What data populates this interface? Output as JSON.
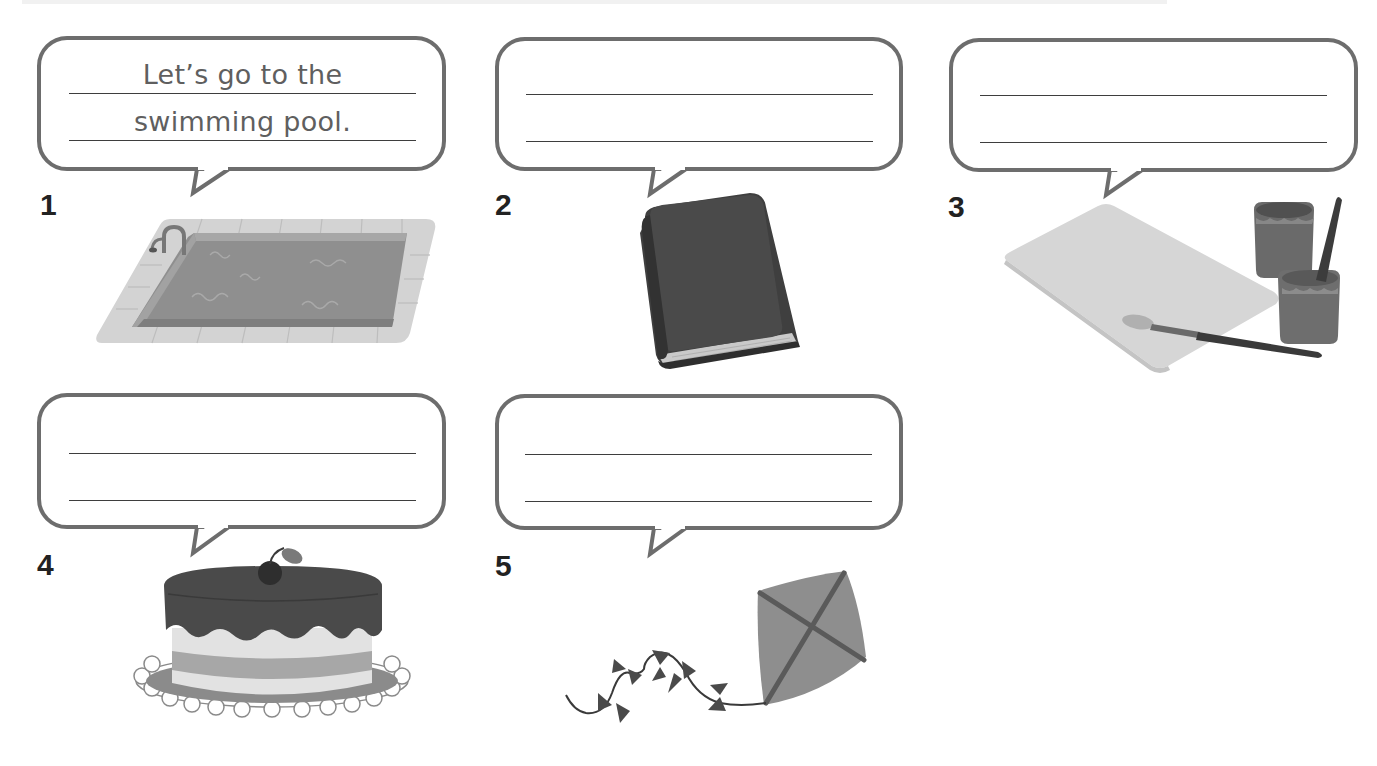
{
  "worksheet": {
    "exercises": [
      {
        "number": "1",
        "picture": "swimming-pool",
        "answer_lines": [
          "Let’s go to the",
          "swimming pool."
        ]
      },
      {
        "number": "2",
        "picture": "book",
        "answer_lines": [
          "",
          ""
        ]
      },
      {
        "number": "3",
        "picture": "paper-and-paints",
        "answer_lines": [
          "",
          ""
        ]
      },
      {
        "number": "4",
        "picture": "cake",
        "answer_lines": [
          "",
          ""
        ]
      },
      {
        "number": "5",
        "picture": "kite",
        "answer_lines": [
          "",
          ""
        ]
      }
    ]
  },
  "colors": {
    "bubble_border": "#6d6d6d",
    "answer_line": "#3e3e3e",
    "example_text": "#5f5f5f",
    "numeral": "#222222"
  }
}
